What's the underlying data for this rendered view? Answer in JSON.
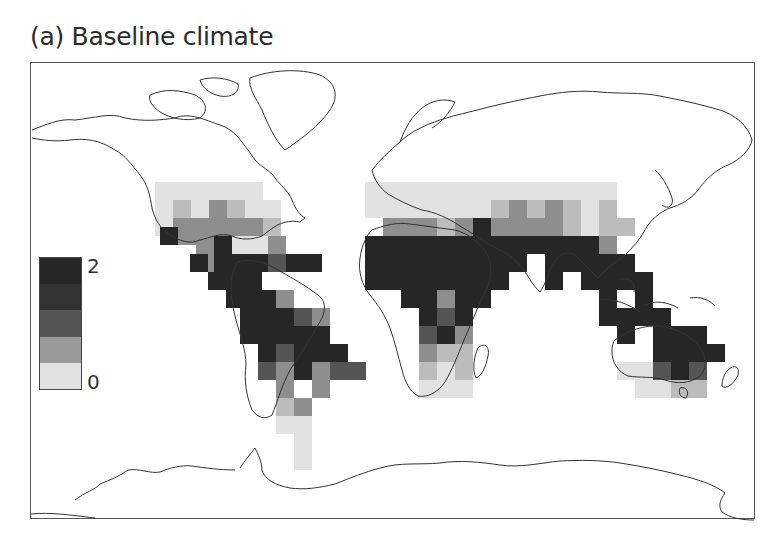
{
  "figure": {
    "title": "(a) Baseline climate"
  },
  "legend": {
    "max_label": "2",
    "min_label": "0",
    "classes": [
      {
        "color": "#262626"
      },
      {
        "color": "#333333"
      },
      {
        "color": "#555555"
      },
      {
        "color": "#9a9a9a"
      },
      {
        "color": "#e2e2e2"
      }
    ]
  },
  "chart_data": {
    "type": "heatmap",
    "title": "(a) Baseline climate",
    "projection": "world map (equirectangular-like)",
    "legend": {
      "min": 0,
      "max": 2,
      "classes": 5,
      "position": "left, mid-height"
    },
    "grid_cell_px": 18,
    "levels_legend": {
      "0": "#e2e2e2",
      "1": "#bcbcbc",
      "2": "#8e8e8e",
      "3": "#555555",
      "4": "#262626"
    },
    "regions": [
      {
        "name": "North America (south)",
        "level_summary": "light to medium"
      },
      {
        "name": "Central America / Caribbean",
        "level_summary": "dark"
      },
      {
        "name": "Northern South America / Amazon",
        "level_summary": "dark"
      },
      {
        "name": "Southern South America",
        "level_summary": "light"
      },
      {
        "name": "Sahel / Central Africa",
        "level_summary": "dark"
      },
      {
        "name": "Southern Africa",
        "level_summary": "light to medium"
      },
      {
        "name": "Middle East / Central Asia",
        "level_summary": "light to medium"
      },
      {
        "name": "South Asia / India",
        "level_summary": "dark"
      },
      {
        "name": "Southeast Asia / Indonesia",
        "level_summary": "dark"
      },
      {
        "name": "Northern Australia",
        "level_summary": "dark"
      },
      {
        "name": "Southern Australia",
        "level_summary": "light"
      },
      {
        "name": "East Asia / China",
        "level_summary": "light to medium"
      }
    ],
    "cells": [
      [
        155,
        182,
        0
      ],
      [
        173,
        182,
        0
      ],
      [
        191,
        182,
        0
      ],
      [
        209,
        182,
        0
      ],
      [
        227,
        182,
        0
      ],
      [
        245,
        182,
        0
      ],
      [
        155,
        200,
        0
      ],
      [
        173,
        200,
        1
      ],
      [
        191,
        200,
        0
      ],
      [
        209,
        200,
        2
      ],
      [
        227,
        200,
        1
      ],
      [
        245,
        200,
        0
      ],
      [
        263,
        200,
        0
      ],
      [
        155,
        218,
        0
      ],
      [
        173,
        218,
        2
      ],
      [
        191,
        218,
        2
      ],
      [
        209,
        218,
        2
      ],
      [
        227,
        218,
        2
      ],
      [
        245,
        218,
        2
      ],
      [
        263,
        218,
        1
      ],
      [
        160,
        227,
        4
      ],
      [
        178,
        227,
        2
      ],
      [
        196,
        236,
        2
      ],
      [
        214,
        236,
        4
      ],
      [
        232,
        236,
        0
      ],
      [
        250,
        236,
        0
      ],
      [
        268,
        236,
        2
      ],
      [
        199,
        254,
        2
      ],
      [
        214,
        254,
        4
      ],
      [
        232,
        254,
        4
      ],
      [
        250,
        254,
        4
      ],
      [
        268,
        254,
        3
      ],
      [
        286,
        254,
        4
      ],
      [
        304,
        254,
        4
      ],
      [
        190,
        254,
        4
      ],
      [
        208,
        272,
        4
      ],
      [
        226,
        272,
        4
      ],
      [
        244,
        272,
        4
      ],
      [
        226,
        290,
        4
      ],
      [
        244,
        290,
        4
      ],
      [
        240,
        308,
        4
      ],
      [
        258,
        308,
        4
      ],
      [
        258,
        290,
        4
      ],
      [
        276,
        290,
        2
      ],
      [
        276,
        308,
        4
      ],
      [
        294,
        308,
        3
      ],
      [
        240,
        326,
        4
      ],
      [
        258,
        326,
        4
      ],
      [
        276,
        326,
        4
      ],
      [
        294,
        326,
        4
      ],
      [
        312,
        326,
        4
      ],
      [
        312,
        308,
        2
      ],
      [
        258,
        344,
        4
      ],
      [
        276,
        344,
        3
      ],
      [
        294,
        344,
        4
      ],
      [
        312,
        344,
        4
      ],
      [
        330,
        344,
        4
      ],
      [
        330,
        362,
        3
      ],
      [
        258,
        362,
        3
      ],
      [
        276,
        362,
        2
      ],
      [
        294,
        362,
        4
      ],
      [
        312,
        362,
        2
      ],
      [
        348,
        362,
        3
      ],
      [
        312,
        380,
        2
      ],
      [
        276,
        380,
        2
      ],
      [
        276,
        398,
        1
      ],
      [
        294,
        398,
        2
      ],
      [
        276,
        416,
        0
      ],
      [
        294,
        416,
        0
      ],
      [
        294,
        434,
        0
      ],
      [
        294,
        452,
        0
      ],
      [
        365,
        182,
        0
      ],
      [
        383,
        182,
        0
      ],
      [
        401,
        182,
        0
      ],
      [
        419,
        182,
        0
      ],
      [
        437,
        182,
        0
      ],
      [
        455,
        182,
        0
      ],
      [
        473,
        182,
        0
      ],
      [
        491,
        182,
        0
      ],
      [
        509,
        182,
        0
      ],
      [
        527,
        182,
        0
      ],
      [
        545,
        182,
        0
      ],
      [
        563,
        182,
        0
      ],
      [
        581,
        182,
        0
      ],
      [
        599,
        182,
        0
      ],
      [
        365,
        200,
        0
      ],
      [
        383,
        200,
        0
      ],
      [
        401,
        200,
        0
      ],
      [
        419,
        200,
        0
      ],
      [
        437,
        200,
        0
      ],
      [
        455,
        200,
        0
      ],
      [
        473,
        200,
        0
      ],
      [
        491,
        200,
        1
      ],
      [
        509,
        200,
        2
      ],
      [
        527,
        200,
        1
      ],
      [
        545,
        200,
        2
      ],
      [
        563,
        200,
        1
      ],
      [
        581,
        200,
        0
      ],
      [
        599,
        200,
        1
      ],
      [
        383,
        218,
        2
      ],
      [
        401,
        218,
        2
      ],
      [
        419,
        218,
        2
      ],
      [
        437,
        218,
        1
      ],
      [
        455,
        218,
        2
      ],
      [
        473,
        218,
        4
      ],
      [
        491,
        218,
        2
      ],
      [
        509,
        218,
        2
      ],
      [
        527,
        218,
        2
      ],
      [
        545,
        218,
        2
      ],
      [
        563,
        218,
        1
      ],
      [
        581,
        218,
        0
      ],
      [
        599,
        218,
        1
      ],
      [
        617,
        218,
        1
      ],
      [
        365,
        236,
        4
      ],
      [
        383,
        236,
        4
      ],
      [
        401,
        236,
        4
      ],
      [
        419,
        236,
        4
      ],
      [
        437,
        236,
        4
      ],
      [
        455,
        236,
        4
      ],
      [
        473,
        236,
        4
      ],
      [
        491,
        236,
        4
      ],
      [
        509,
        236,
        4
      ],
      [
        527,
        236,
        4
      ],
      [
        545,
        236,
        4
      ],
      [
        563,
        236,
        4
      ],
      [
        581,
        236,
        4
      ],
      [
        599,
        236,
        2
      ],
      [
        365,
        254,
        4
      ],
      [
        383,
        254,
        4
      ],
      [
        401,
        254,
        4
      ],
      [
        419,
        254,
        4
      ],
      [
        437,
        254,
        4
      ],
      [
        455,
        254,
        4
      ],
      [
        473,
        254,
        4
      ],
      [
        491,
        254,
        4
      ],
      [
        509,
        254,
        4
      ],
      [
        545,
        254,
        4
      ],
      [
        563,
        254,
        4
      ],
      [
        581,
        254,
        4
      ],
      [
        599,
        254,
        4
      ],
      [
        617,
        254,
        4
      ],
      [
        365,
        272,
        4
      ],
      [
        383,
        272,
        4
      ],
      [
        401,
        272,
        4
      ],
      [
        419,
        272,
        4
      ],
      [
        437,
        272,
        4
      ],
      [
        455,
        272,
        4
      ],
      [
        473,
        272,
        4
      ],
      [
        491,
        272,
        4
      ],
      [
        545,
        272,
        4
      ],
      [
        581,
        272,
        4
      ],
      [
        599,
        272,
        4
      ],
      [
        617,
        272,
        4
      ],
      [
        635,
        272,
        4
      ],
      [
        401,
        290,
        4
      ],
      [
        419,
        290,
        4
      ],
      [
        437,
        290,
        2
      ],
      [
        455,
        290,
        4
      ],
      [
        473,
        290,
        4
      ],
      [
        599,
        290,
        4
      ],
      [
        635,
        290,
        4
      ],
      [
        419,
        308,
        4
      ],
      [
        437,
        308,
        3
      ],
      [
        455,
        308,
        4
      ],
      [
        599,
        308,
        4
      ],
      [
        617,
        308,
        4
      ],
      [
        635,
        308,
        4
      ],
      [
        653,
        308,
        4
      ],
      [
        419,
        326,
        3
      ],
      [
        437,
        326,
        4
      ],
      [
        455,
        326,
        2
      ],
      [
        617,
        326,
        4
      ],
      [
        653,
        326,
        4
      ],
      [
        671,
        326,
        4
      ],
      [
        689,
        326,
        4
      ],
      [
        419,
        344,
        2
      ],
      [
        437,
        344,
        1
      ],
      [
        455,
        344,
        1
      ],
      [
        653,
        344,
        4
      ],
      [
        671,
        344,
        4
      ],
      [
        689,
        344,
        4
      ],
      [
        707,
        344,
        4
      ],
      [
        419,
        362,
        1
      ],
      [
        437,
        362,
        0
      ],
      [
        455,
        362,
        1
      ],
      [
        617,
        362,
        0
      ],
      [
        635,
        362,
        0
      ],
      [
        653,
        362,
        3
      ],
      [
        671,
        362,
        4
      ],
      [
        689,
        362,
        3
      ],
      [
        419,
        380,
        0
      ],
      [
        437,
        380,
        0
      ],
      [
        455,
        380,
        0
      ],
      [
        635,
        380,
        0
      ],
      [
        653,
        380,
        0
      ],
      [
        671,
        380,
        1
      ],
      [
        689,
        380,
        1
      ]
    ]
  }
}
